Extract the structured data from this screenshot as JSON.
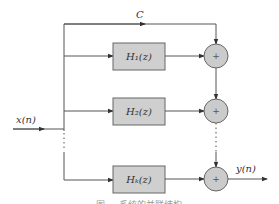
{
  "diagram": {
    "type": "parallel-form filter structure",
    "input_label": "x(n)",
    "output_label": "y(n)",
    "bypass_gain_label": "C",
    "branches": [
      {
        "box_label": "H₁(z)",
        "adder_symbol": "+"
      },
      {
        "box_label": "H₂(z)",
        "adder_symbol": "+"
      },
      {
        "box_label": "Hₖ(z)",
        "adder_symbol": "+"
      }
    ],
    "ellipsis": "⋮"
  },
  "caption": {
    "text": "图 … 系统的并联结构"
  },
  "colors": {
    "wire": "#555555",
    "box_fill": "#cfcfcf",
    "adder_fill": "#cbcbcb",
    "text": "#333333"
  }
}
